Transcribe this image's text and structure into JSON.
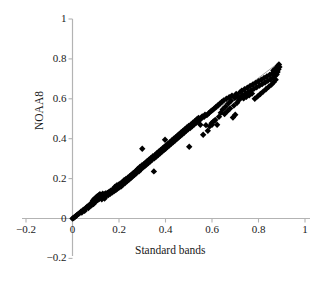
{
  "chart_data": {
    "type": "scatter",
    "title": "",
    "xlabel": "Standard bands",
    "ylabel": "NOAA8",
    "xlim": [
      -0.2,
      1.0
    ],
    "ylim": [
      -0.2,
      1.0
    ],
    "xticks": [
      "-0.2",
      "0",
      "0.2",
      "0.4",
      "0.6",
      "0.8",
      "1"
    ],
    "yticks": [
      "1",
      "0.8",
      "0.6",
      "0.4",
      "0.2",
      "0",
      "-0.2"
    ],
    "xtick_values": [
      -0.2,
      0,
      0.2,
      0.4,
      0.6,
      0.8,
      1
    ],
    "ytick_values": [
      1,
      0.8,
      0.6,
      0.4,
      0.2,
      0,
      -0.2
    ],
    "grid": false,
    "legend": null,
    "marker": "diamond",
    "marker_color": "#000000",
    "marker_size": 3.2,
    "axis_color": "#b3b3b3",
    "trendline": {
      "type": "linear",
      "color": "#8c8c8c",
      "width": 0.8,
      "x": [
        0.0,
        0.88
      ],
      "y": [
        0.0,
        0.775
      ],
      "slope": 0.88,
      "intercept": 0.0
    },
    "series": [
      {
        "name": "NOAA8 vs Standard bands",
        "points": [
          [
            0.0,
            0.0
          ],
          [
            0.004,
            0.002
          ],
          [
            0.008,
            0.006
          ],
          [
            0.012,
            0.01
          ],
          [
            0.016,
            0.014
          ],
          [
            0.02,
            0.018
          ],
          [
            0.024,
            0.022
          ],
          [
            0.03,
            0.026
          ],
          [
            0.036,
            0.034
          ],
          [
            0.04,
            0.03
          ],
          [
            0.044,
            0.04
          ],
          [
            0.048,
            0.044
          ],
          [
            0.052,
            0.038
          ],
          [
            0.056,
            0.05
          ],
          [
            0.06,
            0.054
          ],
          [
            0.064,
            0.06
          ],
          [
            0.068,
            0.052
          ],
          [
            0.072,
            0.064
          ],
          [
            0.076,
            0.07
          ],
          [
            0.08,
            0.076
          ],
          [
            0.082,
            0.066
          ],
          [
            0.086,
            0.08
          ],
          [
            0.088,
            0.09
          ],
          [
            0.09,
            0.072
          ],
          [
            0.092,
            0.086
          ],
          [
            0.094,
            0.098
          ],
          [
            0.096,
            0.082
          ],
          [
            0.098,
            0.094
          ],
          [
            0.1,
            0.104
          ],
          [
            0.102,
            0.088
          ],
          [
            0.104,
            0.1
          ],
          [
            0.106,
            0.11
          ],
          [
            0.108,
            0.092
          ],
          [
            0.11,
            0.106
          ],
          [
            0.112,
            0.116
          ],
          [
            0.114,
            0.098
          ],
          [
            0.116,
            0.112
          ],
          [
            0.118,
            0.122
          ],
          [
            0.12,
            0.102
          ],
          [
            0.122,
            0.108
          ],
          [
            0.124,
            0.118
          ],
          [
            0.126,
            0.096
          ],
          [
            0.128,
            0.114
          ],
          [
            0.13,
            0.124
          ],
          [
            0.132,
            0.106
          ],
          [
            0.134,
            0.11
          ],
          [
            0.136,
            0.12
          ],
          [
            0.138,
            0.1
          ],
          [
            0.14,
            0.116
          ],
          [
            0.142,
            0.126
          ],
          [
            0.144,
            0.112
          ],
          [
            0.146,
            0.122
          ],
          [
            0.15,
            0.128
          ],
          [
            0.154,
            0.118
          ],
          [
            0.158,
            0.134
          ],
          [
            0.162,
            0.124
          ],
          [
            0.166,
            0.14
          ],
          [
            0.17,
            0.13
          ],
          [
            0.174,
            0.146
          ],
          [
            0.178,
            0.136
          ],
          [
            0.182,
            0.158
          ],
          [
            0.186,
            0.142
          ],
          [
            0.19,
            0.166
          ],
          [
            0.194,
            0.15
          ],
          [
            0.198,
            0.17
          ],
          [
            0.202,
            0.156
          ],
          [
            0.206,
            0.176
          ],
          [
            0.21,
            0.162
          ],
          [
            0.214,
            0.182
          ],
          [
            0.218,
            0.172
          ],
          [
            0.222,
            0.192
          ],
          [
            0.226,
            0.178
          ],
          [
            0.23,
            0.198
          ],
          [
            0.234,
            0.186
          ],
          [
            0.238,
            0.204
          ],
          [
            0.242,
            0.194
          ],
          [
            0.246,
            0.212
          ],
          [
            0.25,
            0.202
          ],
          [
            0.254,
            0.22
          ],
          [
            0.258,
            0.21
          ],
          [
            0.262,
            0.228
          ],
          [
            0.266,
            0.218
          ],
          [
            0.27,
            0.236
          ],
          [
            0.274,
            0.226
          ],
          [
            0.278,
            0.244
          ],
          [
            0.282,
            0.25
          ],
          [
            0.286,
            0.236
          ],
          [
            0.29,
            0.258
          ],
          [
            0.294,
            0.246
          ],
          [
            0.298,
            0.266
          ],
          [
            0.3,
            0.35
          ],
          [
            0.302,
            0.256
          ],
          [
            0.306,
            0.272
          ],
          [
            0.31,
            0.262
          ],
          [
            0.314,
            0.28
          ],
          [
            0.318,
            0.27
          ],
          [
            0.322,
            0.288
          ],
          [
            0.326,
            0.278
          ],
          [
            0.33,
            0.296
          ],
          [
            0.334,
            0.286
          ],
          [
            0.338,
            0.304
          ],
          [
            0.342,
            0.294
          ],
          [
            0.346,
            0.312
          ],
          [
            0.35,
            0.236
          ],
          [
            0.352,
            0.302
          ],
          [
            0.356,
            0.32
          ],
          [
            0.36,
            0.31
          ],
          [
            0.364,
            0.328
          ],
          [
            0.368,
            0.318
          ],
          [
            0.372,
            0.336
          ],
          [
            0.376,
            0.326
          ],
          [
            0.38,
            0.344
          ],
          [
            0.384,
            0.334
          ],
          [
            0.388,
            0.352
          ],
          [
            0.392,
            0.342
          ],
          [
            0.396,
            0.36
          ],
          [
            0.398,
            0.395
          ],
          [
            0.4,
            0.35
          ],
          [
            0.404,
            0.368
          ],
          [
            0.408,
            0.358
          ],
          [
            0.412,
            0.376
          ],
          [
            0.416,
            0.366
          ],
          [
            0.42,
            0.384
          ],
          [
            0.424,
            0.374
          ],
          [
            0.428,
            0.392
          ],
          [
            0.432,
            0.382
          ],
          [
            0.436,
            0.4
          ],
          [
            0.44,
            0.39
          ],
          [
            0.444,
            0.408
          ],
          [
            0.448,
            0.398
          ],
          [
            0.452,
            0.416
          ],
          [
            0.456,
            0.406
          ],
          [
            0.46,
            0.424
          ],
          [
            0.464,
            0.414
          ],
          [
            0.468,
            0.432
          ],
          [
            0.472,
            0.422
          ],
          [
            0.476,
            0.44
          ],
          [
            0.48,
            0.43
          ],
          [
            0.484,
            0.448
          ],
          [
            0.488,
            0.438
          ],
          [
            0.492,
            0.456
          ],
          [
            0.496,
            0.446
          ],
          [
            0.5,
            0.464
          ],
          [
            0.502,
            0.36
          ],
          [
            0.506,
            0.454
          ],
          [
            0.51,
            0.472
          ],
          [
            0.514,
            0.462
          ],
          [
            0.518,
            0.48
          ],
          [
            0.522,
            0.47
          ],
          [
            0.526,
            0.488
          ],
          [
            0.53,
            0.478
          ],
          [
            0.534,
            0.496
          ],
          [
            0.538,
            0.486
          ],
          [
            0.542,
            0.504
          ],
          [
            0.546,
            0.494
          ],
          [
            0.55,
            0.47
          ],
          [
            0.554,
            0.502
          ],
          [
            0.558,
            0.512
          ],
          [
            0.562,
            0.42
          ],
          [
            0.566,
            0.51
          ],
          [
            0.57,
            0.52
          ],
          [
            0.574,
            0.468
          ],
          [
            0.578,
            0.518
          ],
          [
            0.582,
            0.44
          ],
          [
            0.586,
            0.528
          ],
          [
            0.59,
            0.462
          ],
          [
            0.594,
            0.536
          ],
          [
            0.598,
            0.478
          ],
          [
            0.6,
            0.47
          ],
          [
            0.602,
            0.544
          ],
          [
            0.606,
            0.486
          ],
          [
            0.61,
            0.552
          ],
          [
            0.614,
            0.494
          ],
          [
            0.618,
            0.56
          ],
          [
            0.622,
            0.47
          ],
          [
            0.626,
            0.568
          ],
          [
            0.63,
            0.51
          ],
          [
            0.634,
            0.576
          ],
          [
            0.638,
            0.53
          ],
          [
            0.642,
            0.584
          ],
          [
            0.646,
            0.546
          ],
          [
            0.65,
            0.592
          ],
          [
            0.654,
            0.524
          ],
          [
            0.658,
            0.56
          ],
          [
            0.662,
            0.6
          ],
          [
            0.666,
            0.538
          ],
          [
            0.67,
            0.576
          ],
          [
            0.674,
            0.608
          ],
          [
            0.678,
            0.552
          ],
          [
            0.682,
            0.59
          ],
          [
            0.686,
            0.616
          ],
          [
            0.69,
            0.506
          ],
          [
            0.694,
            0.566
          ],
          [
            0.698,
            0.604
          ],
          [
            0.7,
            0.52
          ],
          [
            0.704,
            0.624
          ],
          [
            0.708,
            0.58
          ],
          [
            0.712,
            0.612
          ],
          [
            0.716,
            0.594
          ],
          [
            0.72,
            0.632
          ],
          [
            0.724,
            0.606
          ],
          [
            0.728,
            0.64
          ],
          [
            0.732,
            0.618
          ],
          [
            0.736,
            0.602
          ],
          [
            0.74,
            0.648
          ],
          [
            0.744,
            0.626
          ],
          [
            0.748,
            0.61
          ],
          [
            0.752,
            0.656
          ],
          [
            0.756,
            0.634
          ],
          [
            0.76,
            0.618
          ],
          [
            0.764,
            0.664
          ],
          [
            0.768,
            0.642
          ],
          [
            0.772,
            0.626
          ],
          [
            0.776,
            0.672
          ],
          [
            0.78,
            0.65
          ],
          [
            0.784,
            0.6
          ],
          [
            0.788,
            0.68
          ],
          [
            0.792,
            0.658
          ],
          [
            0.796,
            0.612
          ],
          [
            0.8,
            0.688
          ],
          [
            0.804,
            0.666
          ],
          [
            0.808,
            0.624
          ],
          [
            0.812,
            0.696
          ],
          [
            0.816,
            0.674
          ],
          [
            0.82,
            0.636
          ],
          [
            0.824,
            0.704
          ],
          [
            0.828,
            0.682
          ],
          [
            0.832,
            0.648
          ],
          [
            0.836,
            0.712
          ],
          [
            0.84,
            0.69
          ],
          [
            0.844,
            0.66
          ],
          [
            0.848,
            0.72
          ],
          [
            0.852,
            0.698
          ],
          [
            0.856,
            0.672
          ],
          [
            0.86,
            0.728
          ],
          [
            0.862,
            0.706
          ],
          [
            0.864,
            0.742
          ],
          [
            0.866,
            0.684
          ],
          [
            0.868,
            0.736
          ],
          [
            0.87,
            0.714
          ],
          [
            0.872,
            0.75
          ],
          [
            0.874,
            0.696
          ],
          [
            0.876,
            0.744
          ],
          [
            0.878,
            0.722
          ],
          [
            0.88,
            0.758
          ],
          [
            0.882,
            0.734
          ],
          [
            0.884,
            0.766
          ],
          [
            0.886,
            0.748
          ],
          [
            0.888,
            0.772
          ],
          [
            0.89,
            0.76
          ]
        ]
      }
    ]
  }
}
